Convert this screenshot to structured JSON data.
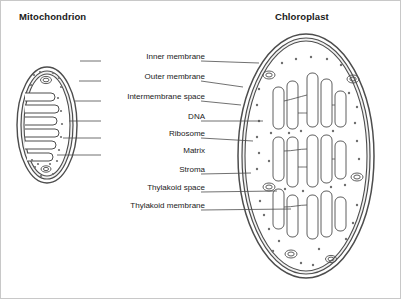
{
  "diagram": {
    "titles": {
      "mitochondrion": "Mitochondrion",
      "chloroplast": "Chloroplast"
    },
    "labels": [
      {
        "id": "inner-membrane",
        "text": "Inner membrane",
        "y": 56
      },
      {
        "id": "outer-membrane",
        "text": "Outer membrane",
        "y": 76
      },
      {
        "id": "intermembrane-space",
        "text": "Intermembrane space",
        "y": 96
      },
      {
        "id": "dna",
        "text": "DNA",
        "y": 116
      },
      {
        "id": "ribosome",
        "text": "Ribosome",
        "y": 133
      },
      {
        "id": "matrix",
        "text": "Matrix",
        "y": 150
      },
      {
        "id": "stroma",
        "text": "Stroma",
        "y": 169
      },
      {
        "id": "thylakoid-space",
        "text": "Thylakoid space",
        "y": 187
      },
      {
        "id": "thylakoid-membrane",
        "text": "Thylakoid membrane",
        "y": 205
      }
    ],
    "colors": {
      "outline": "#4d4d4d",
      "fill": "#ffffff",
      "membrane_fill": "#e8e8e8",
      "text": "#1a1a1a",
      "leader_line": "#4d4d4d",
      "frame": "#c8c8c8"
    }
  }
}
